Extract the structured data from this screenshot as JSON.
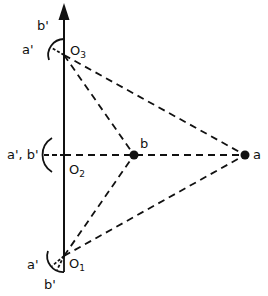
{
  "diagram": {
    "axis": {
      "x": 64,
      "y_top": 4,
      "y_bottom": 257,
      "arrow": true
    },
    "observers": [
      {
        "id": "O3",
        "label": "O",
        "sub": "3",
        "x": 64,
        "y": 55,
        "arc_labels": [
          "a'",
          "b'"
        ]
      },
      {
        "id": "O2",
        "label": "O",
        "sub": "2",
        "x": 64,
        "y": 155,
        "arc_labels": [
          "a', b'"
        ]
      },
      {
        "id": "O1",
        "label": "O",
        "sub": "1",
        "x": 64,
        "y": 256,
        "arc_labels": [
          "a'",
          "b'"
        ]
      }
    ],
    "targets": [
      {
        "id": "b",
        "label": "b",
        "x": 134,
        "y": 155
      },
      {
        "id": "a",
        "label": "a",
        "x": 245,
        "y": 155
      }
    ],
    "labels": {
      "o3_a": "a'",
      "o3_b": "b'",
      "o2_ab": "a', b'",
      "o1_a": "a'",
      "o1_b": "b'",
      "o_letter": "O",
      "sub1": "1",
      "sub2": "2",
      "sub3": "3",
      "point_a": "a",
      "point_b": "b"
    },
    "colors": {
      "line": "#111111",
      "background": "#ffffff"
    }
  }
}
